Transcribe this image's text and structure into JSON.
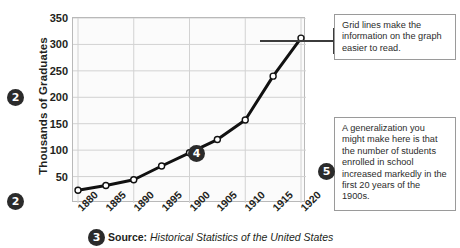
{
  "chart_data": {
    "type": "line",
    "title": "",
    "xlabel": "",
    "ylabel": "Thousands of Graduates",
    "categories": [
      "1880",
      "1885",
      "1890",
      "1895",
      "1900",
      "1905",
      "1910",
      "1915",
      "1920"
    ],
    "x": [
      1880,
      1885,
      1890,
      1895,
      1900,
      1905,
      1910,
      1915,
      1920
    ],
    "values": [
      24,
      33,
      44,
      70,
      95,
      120,
      157,
      240,
      312
    ],
    "series": [
      {
        "name": "Thousands of Graduates",
        "values": [
          24,
          33,
          44,
          70,
          95,
          120,
          157,
          240,
          312
        ]
      }
    ],
    "xlim": [
      1880,
      1920
    ],
    "ylim": [
      0,
      350
    ],
    "y_ticks": [
      "50",
      "100",
      "150",
      "200",
      "250",
      "300",
      "350"
    ],
    "y_tick_values": [
      50,
      100,
      150,
      200,
      250,
      300,
      350
    ],
    "grid": true,
    "legend": "none",
    "line_color": "#111111",
    "marker_fill": "#ffffff",
    "marker_edge": "#111111",
    "plot_background": "#fbfbfb",
    "grid_color": "#d2d2d2"
  },
  "axis": {
    "y_title": "Thousands of Graduates"
  },
  "markers": {
    "two_a": "2",
    "two_b": "2",
    "three": "3",
    "four": "4",
    "five": "5"
  },
  "source": {
    "label": "Source:",
    "text": "Historical Statistics of the United States"
  },
  "callouts": [
    {
      "id": "grid-lines-note",
      "text": "Grid lines make the information on the graph easier to read."
    },
    {
      "id": "generalization-note",
      "text": "A generalization you might make here is that the number of students enrolled in school increased markedly in the first 20 years of the 1900s."
    }
  ]
}
